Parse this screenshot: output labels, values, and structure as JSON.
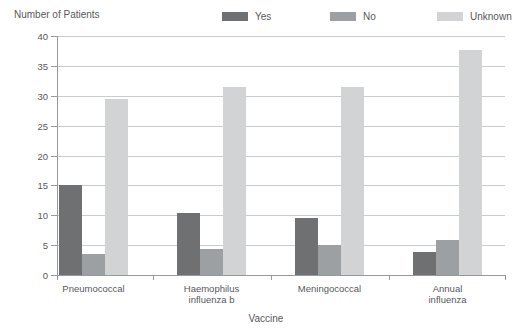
{
  "chart_data": {
    "type": "bar",
    "title": "",
    "ylabel": "Number of Patients",
    "xlabel": "Vaccine",
    "categories": [
      "Pneumococcal",
      "Haemophilus\ninfluenza b",
      "Meningococcal",
      "Annual\ninfluenza"
    ],
    "series": [
      {
        "name": "Yes",
        "color": "#6e7072",
        "values": [
          15.0,
          10.3,
          9.5,
          3.9
        ]
      },
      {
        "name": "No",
        "color": "#9da0a2",
        "values": [
          3.5,
          4.4,
          5.1,
          5.9
        ]
      },
      {
        "name": "Unknown",
        "color": "#d1d3d4",
        "values": [
          29.5,
          31.4,
          31.5,
          37.7
        ]
      }
    ],
    "ylim": [
      0,
      40
    ],
    "ytick_step": 5,
    "grid": true,
    "legend_position": "top"
  },
  "colors": {
    "axis": "#97999b",
    "grid": "#c9cbcd",
    "text": "#58595b"
  }
}
